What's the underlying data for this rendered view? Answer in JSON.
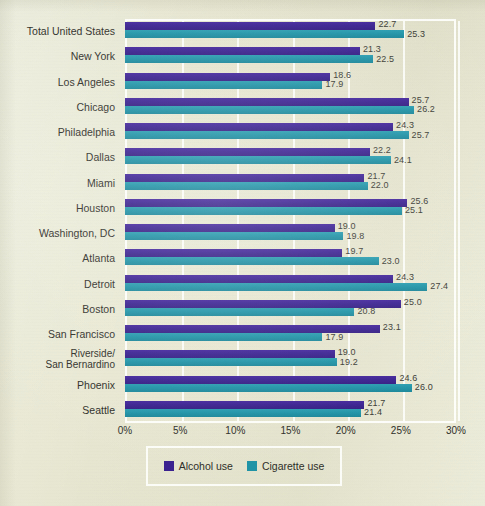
{
  "chart_data": {
    "type": "bar",
    "orientation": "horizontal",
    "title": "",
    "xlabel": "",
    "ylabel": "",
    "xlim": [
      0,
      30
    ],
    "xticks": [
      "0%",
      "5%",
      "10%",
      "15%",
      "20%",
      "25%",
      "30%"
    ],
    "xtick_values": [
      0,
      5,
      10,
      15,
      20,
      25,
      30
    ],
    "grid": true,
    "legend_position": "bottom",
    "categories": [
      "Total United States",
      "New York",
      "Los Angeles",
      "Chicago",
      "Philadelphia",
      "Dallas",
      "Miami",
      "Houston",
      "Washington, DC",
      "Atlanta",
      "Detroit",
      "Boston",
      "San Francisco",
      "Riverside/\nSan Bernardino",
      "Phoenix",
      "Seattle"
    ],
    "series": [
      {
        "name": "Alcohol use",
        "color": "#3a2190",
        "values": [
          22.7,
          21.3,
          18.6,
          25.7,
          24.3,
          22.2,
          21.7,
          25.6,
          19.0,
          19.7,
          24.3,
          25.0,
          23.1,
          19.0,
          24.6,
          21.7
        ],
        "labels": [
          "22.7",
          "21.3",
          "18.6",
          "25.7",
          "24.3",
          "22.2",
          "21.7",
          "25.6",
          "19.0",
          "19.7",
          "24.3",
          "25.0",
          "23.1",
          "19.0",
          "24.6",
          "21.7"
        ]
      },
      {
        "name": "Cigarette use",
        "color": "#1f93a6",
        "values": [
          25.3,
          22.5,
          17.9,
          26.2,
          25.7,
          24.1,
          22.0,
          25.1,
          19.8,
          23.0,
          27.4,
          20.8,
          17.9,
          19.2,
          26.0,
          21.4
        ],
        "labels": [
          "25.3",
          "22.5",
          "17.9",
          "26.2",
          "25.7",
          "24.1",
          "22.0",
          "25.1",
          "19.8",
          "23.0",
          "27.4",
          "20.8",
          "17.9",
          "19.2",
          "26.0",
          "21.4"
        ]
      }
    ]
  },
  "legend": {
    "items": [
      {
        "label": "Alcohol use",
        "color": "#3a2190"
      },
      {
        "label": "Cigarette use",
        "color": "#1f93a6"
      }
    ]
  },
  "colors": {
    "background": "#e7e7d1",
    "alcohol": "#3a2190",
    "cigarette": "#1f93a6",
    "gridline": "#ffffff",
    "text": "#2e2e28"
  }
}
